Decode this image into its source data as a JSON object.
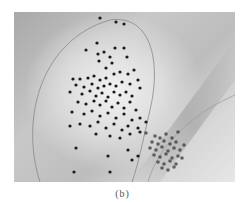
{
  "figure": {
    "caption": "(b)"
  },
  "chart_data": {
    "type": "scatter",
    "title": "",
    "xlabel": "",
    "ylabel": "",
    "grid": false,
    "legend": [],
    "annotations": [
      "(b)"
    ],
    "background": "grayscale gradient with two curved contour boundaries",
    "series": [
      {
        "name": "cluster-1 (large, sparse)",
        "color": "#1a1a1a",
        "points": [
          [
            100,
            18
          ],
          [
            116,
            22
          ],
          [
            124,
            24
          ],
          [
            97,
            43
          ],
          [
            86,
            50
          ],
          [
            98,
            54
          ],
          [
            115,
            48
          ],
          [
            124,
            48
          ],
          [
            104,
            52
          ],
          [
            99,
            61
          ],
          [
            110,
            57
          ],
          [
            127,
            57
          ],
          [
            112,
            63
          ],
          [
            106,
            68
          ],
          [
            73,
            79
          ],
          [
            80,
            79
          ],
          [
            88,
            78
          ],
          [
            94,
            76
          ],
          [
            100,
            80
          ],
          [
            106,
            78
          ],
          [
            114,
            74
          ],
          [
            120,
            72
          ],
          [
            128,
            74
          ],
          [
            134,
            70
          ],
          [
            76,
            85
          ],
          [
            84,
            87
          ],
          [
            92,
            84
          ],
          [
            98,
            88
          ],
          [
            104,
            86
          ],
          [
            110,
            84
          ],
          [
            116,
            86
          ],
          [
            122,
            82
          ],
          [
            130,
            84
          ],
          [
            138,
            80
          ],
          [
            70,
            92
          ],
          [
            82,
            94
          ],
          [
            90,
            91
          ],
          [
            96,
            96
          ],
          [
            102,
            93
          ],
          [
            108,
            97
          ],
          [
            114,
            92
          ],
          [
            120,
            95
          ],
          [
            126,
            92
          ],
          [
            132,
            96
          ],
          [
            140,
            88
          ],
          [
            78,
            102
          ],
          [
            86,
            104
          ],
          [
            94,
            101
          ],
          [
            100,
            105
          ],
          [
            106,
            101
          ],
          [
            112,
            107
          ],
          [
            118,
            103
          ],
          [
            124,
            108
          ],
          [
            130,
            102
          ],
          [
            136,
            110
          ],
          [
            72,
            112
          ],
          [
            84,
            114
          ],
          [
            92,
            111
          ],
          [
            100,
            116
          ],
          [
            108,
            113
          ],
          [
            116,
            118
          ],
          [
            124,
            114
          ],
          [
            132,
            120
          ],
          [
            140,
            118
          ],
          [
            80,
            124
          ],
          [
            90,
            126
          ],
          [
            98,
            122
          ],
          [
            106,
            128
          ],
          [
            114,
            124
          ],
          [
            122,
            130
          ],
          [
            128,
            126
          ],
          [
            138,
            128
          ],
          [
            146,
            122
          ],
          [
            70,
            126
          ],
          [
            96,
            134
          ],
          [
            110,
            136
          ],
          [
            120,
            138
          ],
          [
            130,
            134
          ],
          [
            140,
            132
          ],
          [
            76,
            148
          ],
          [
            108,
            156
          ],
          [
            128,
            150
          ],
          [
            138,
            156
          ],
          [
            74,
            172
          ],
          [
            110,
            172
          ],
          [
            132,
            160
          ]
        ]
      },
      {
        "name": "cluster-2 (small, dense)",
        "color": "#3a3a3a",
        "points": [
          [
            155,
            136
          ],
          [
            160,
            138
          ],
          [
            166,
            134
          ],
          [
            172,
            138
          ],
          [
            178,
            132
          ],
          [
            152,
            142
          ],
          [
            158,
            144
          ],
          [
            164,
            141
          ],
          [
            170,
            144
          ],
          [
            176,
            142
          ],
          [
            150,
            148
          ],
          [
            156,
            150
          ],
          [
            162,
            147
          ],
          [
            168,
            151
          ],
          [
            174,
            148
          ],
          [
            180,
            150
          ],
          [
            154,
            155
          ],
          [
            160,
            157
          ],
          [
            166,
            154
          ],
          [
            172,
            158
          ],
          [
            178,
            156
          ],
          [
            158,
            162
          ],
          [
            164,
            164
          ],
          [
            170,
            161
          ],
          [
            176,
            164
          ],
          [
            162,
            168
          ],
          [
            168,
            170
          ],
          [
            174,
            167
          ],
          [
            146,
            133
          ],
          [
            184,
            145
          ],
          [
            182,
            158
          ]
        ]
      }
    ],
    "contours": [
      {
        "name": "boundary-1",
        "shape": "large ellipse arc around cluster-1"
      },
      {
        "name": "boundary-2",
        "shape": "diagonal curved band arc around cluster-2"
      }
    ]
  }
}
